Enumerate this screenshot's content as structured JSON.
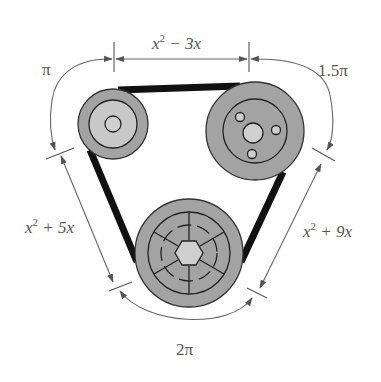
{
  "diagram": {
    "colors": {
      "belt": "#111111",
      "pulley_fill": "#a3a3a3",
      "inner_fill": "#c8c8c8",
      "dimension_lines": "#666666",
      "label_text": "#555555"
    },
    "labels": {
      "top_segment": {
        "base": "x",
        "sup": "2",
        "rest": " − 3x"
      },
      "left_segment": {
        "base": "x",
        "sup": "2",
        "rest": " + 5x"
      },
      "right_segment": {
        "base": "x",
        "sup": "2",
        "rest": " + 9x"
      },
      "arc_top_left": "π",
      "arc_top_right": "1.5π",
      "arc_bottom": "2π"
    },
    "pulleys": [
      {
        "name": "top-left-pulley",
        "type": "small",
        "features": [
          "inner-ring",
          "center-hub"
        ]
      },
      {
        "name": "top-right-pulley",
        "type": "medium",
        "features": [
          "inner-ring",
          "center-hub",
          "three-bolt-holes"
        ]
      },
      {
        "name": "bottom-pulley",
        "type": "large",
        "features": [
          "inner-ring",
          "dashed-ring",
          "spokes",
          "hexagonal-hub"
        ]
      }
    ]
  }
}
